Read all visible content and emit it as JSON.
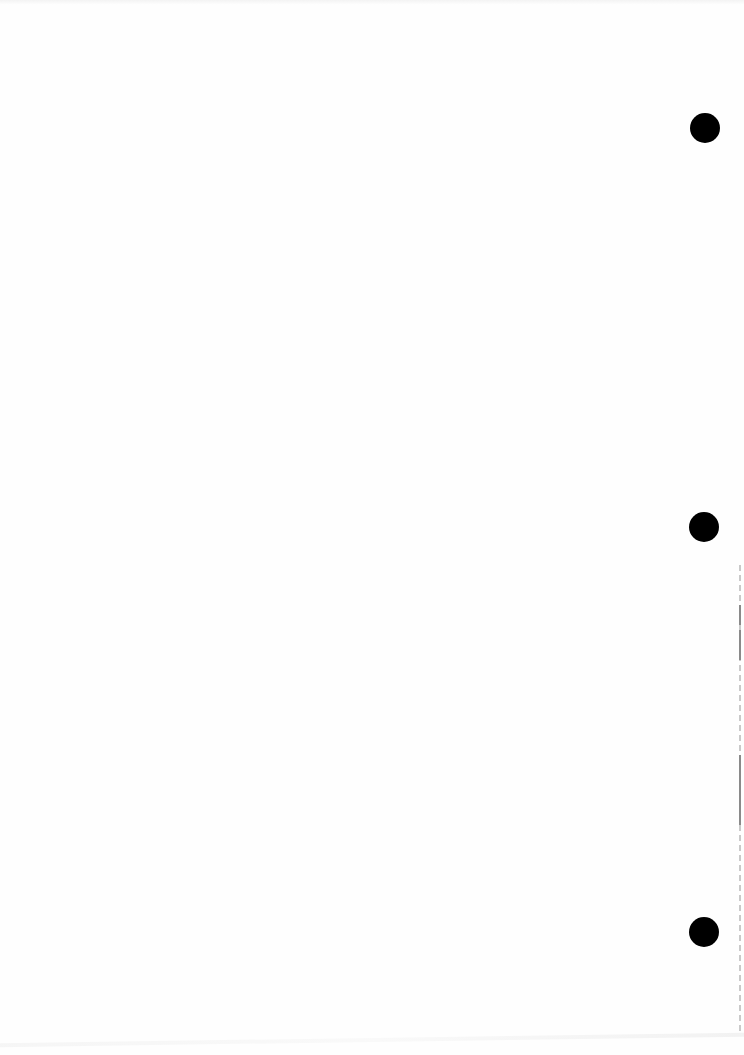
{
  "document": {
    "type": "blank scanned page",
    "text": "",
    "punch_holes": [
      {
        "name": "top",
        "cx": 705,
        "cy": 128,
        "r": 15
      },
      {
        "name": "middle",
        "cx": 704,
        "cy": 527,
        "r": 15
      },
      {
        "name": "bottom",
        "cx": 704,
        "cy": 932,
        "r": 15
      }
    ],
    "colors": {
      "paper": "#fefefe",
      "hole": "#000000",
      "edge": "#bdbdbd"
    }
  }
}
